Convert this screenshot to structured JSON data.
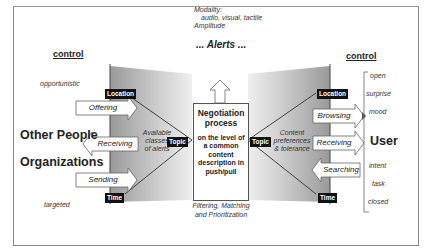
{
  "top": {
    "modality_label": "Modality:",
    "modality_values": "audio, visual, tactile",
    "amplitude_label": "Amplitude",
    "alerts_title": "... Alerts ..."
  },
  "left": {
    "control_heading": "control",
    "control_top": "opportunistic",
    "control_bottom": "targeted",
    "actor_line1": "Other People",
    "actor_line2": "Organizations",
    "actions": [
      "Offering",
      "Receiving",
      "Sending"
    ],
    "band_text": [
      "Available",
      "classes",
      "of alerts"
    ],
    "tag_location": "Location",
    "tag_topic": "Topic",
    "tag_time": "Time"
  },
  "center": {
    "title_line1": "Negotiation",
    "title_line2": "process",
    "desc": [
      "on the level of",
      "a common",
      "content",
      "description in",
      "push/pull"
    ],
    "caption_line1": "Filtering, Matching",
    "caption_line2": "and Prioritization"
  },
  "right": {
    "control_heading": "control",
    "control_items_top": [
      "open",
      "surprise",
      "mood"
    ],
    "actor": "User",
    "control_items_bottom": [
      "intent",
      "task",
      "closed"
    ],
    "actions": [
      "Browsing",
      "Receiving",
      "Searching"
    ],
    "band_text": [
      "Content",
      "preferences",
      "& tolerance"
    ],
    "tag_location": "Location",
    "tag_topic": "Topic",
    "tag_time": "Time"
  }
}
